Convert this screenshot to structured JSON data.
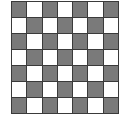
{
  "board": {
    "rows": 7,
    "cols": 7,
    "colors": {
      "dark": "#7a7a7a",
      "light": "#ffffff",
      "border": "#3a3a3a"
    },
    "pattern": [
      [
        "dark",
        "light",
        "dark",
        "light",
        "dark",
        "light",
        "dark"
      ],
      [
        "light",
        "dark",
        "light",
        "dark",
        "light",
        "dark",
        "light"
      ],
      [
        "dark",
        "light",
        "dark",
        "light",
        "dark",
        "light",
        "dark"
      ],
      [
        "light",
        "dark",
        "light",
        "dark",
        "light",
        "dark",
        "light"
      ],
      [
        "dark",
        "light",
        "dark",
        "light",
        "dark",
        "light",
        "dark"
      ],
      [
        "light",
        "dark",
        "light",
        "dark",
        "light",
        "dark",
        "light"
      ],
      [
        "dark",
        "light",
        "dark",
        "light",
        "dark",
        "light",
        "dark"
      ]
    ]
  }
}
